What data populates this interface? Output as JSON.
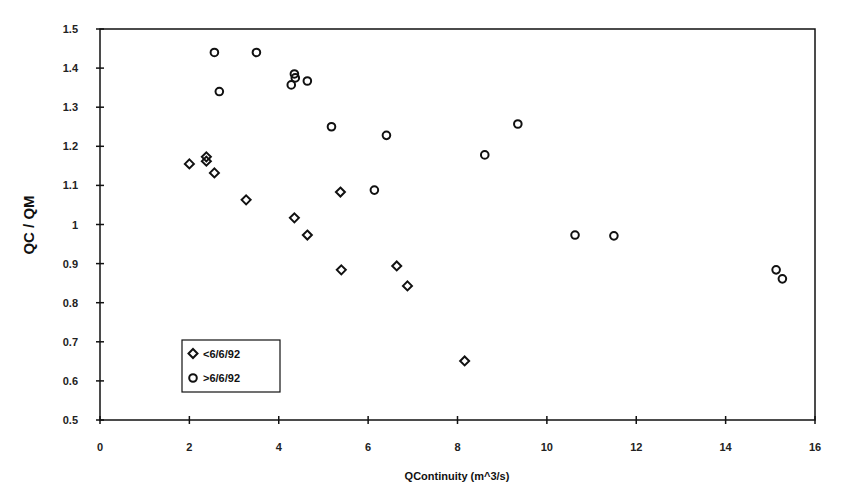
{
  "chart_data": {
    "type": "scatter",
    "title": "",
    "xlabel": "QContinuity (m^3/s)",
    "ylabel": "QC / QM",
    "xlim": [
      0,
      16
    ],
    "ylim": [
      0.5,
      1.5
    ],
    "xticks": [
      0,
      2,
      4,
      6,
      8,
      10,
      12,
      14,
      16
    ],
    "yticks": [
      0.5,
      0.6,
      0.7,
      0.8,
      0.9,
      1,
      1.1,
      1.2,
      1.3,
      1.4,
      1.5
    ],
    "ytick_labels": [
      "0.5",
      "0.6",
      "0.7",
      "0.8",
      "0.9",
      "1",
      "1.1",
      "1.2",
      "1.3",
      "1.4",
      "1.5"
    ],
    "grid": false,
    "legend_position": "lower-left inside",
    "series": [
      {
        "name": "<6/6/92",
        "marker": "diamond",
        "points": [
          [
            2.0,
            1.155
          ],
          [
            2.38,
            1.173
          ],
          [
            2.38,
            1.162
          ],
          [
            2.56,
            1.132
          ],
          [
            3.27,
            1.063
          ],
          [
            4.35,
            1.017
          ],
          [
            4.64,
            0.973
          ],
          [
            5.38,
            1.083
          ],
          [
            5.4,
            0.884
          ],
          [
            6.64,
            0.894
          ],
          [
            6.88,
            0.843
          ],
          [
            8.16,
            0.651
          ]
        ]
      },
      {
        "name": ">6/6/92",
        "marker": "circle",
        "points": [
          [
            2.56,
            1.44
          ],
          [
            3.5,
            1.44
          ],
          [
            2.67,
            1.34
          ],
          [
            4.35,
            1.385
          ],
          [
            4.37,
            1.375
          ],
          [
            4.28,
            1.357
          ],
          [
            4.64,
            1.367
          ],
          [
            5.18,
            1.25
          ],
          [
            6.41,
            1.228
          ],
          [
            9.35,
            1.257
          ],
          [
            8.61,
            1.178
          ],
          [
            6.14,
            1.088
          ],
          [
            10.63,
            0.973
          ],
          [
            11.5,
            0.971
          ],
          [
            15.13,
            0.884
          ],
          [
            15.27,
            0.861
          ]
        ]
      }
    ]
  },
  "legend": {
    "items": [
      {
        "label": "<6/6/92",
        "icon": "diamond-marker-icon"
      },
      {
        "label": ">6/6/92",
        "icon": "circle-marker-icon"
      }
    ]
  },
  "colors": {
    "ink": "#111111",
    "background": "#ffffff"
  }
}
